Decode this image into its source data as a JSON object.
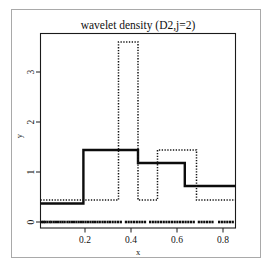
{
  "figure": {
    "title": "wavelet density (D2,j=2)",
    "xlabel": "x",
    "ylabel": "y",
    "background_color": "#ffffff",
    "frame_color": "#a9a9a9"
  },
  "axes": {
    "x_ticks": [
      "0.2",
      "0.4",
      "0.6",
      "0.8"
    ],
    "y_ticks": [
      "0",
      "1",
      "2",
      "3"
    ]
  },
  "chart_data": {
    "type": "line",
    "title": "wavelet density (D2,j=2)",
    "xlabel": "x",
    "ylabel": "y",
    "xlim": [
      0.0,
      1.0
    ],
    "ylim": [
      0.0,
      3.9
    ],
    "grid": false,
    "legend_position": "none",
    "x_tick_values": [
      0.2,
      0.4,
      0.6,
      0.8
    ],
    "y_tick_values": [
      0,
      1,
      2,
      3
    ],
    "series": [
      {
        "name": "wavelet density estimate",
        "style": "solid",
        "color": "#0c0c0c",
        "linewidth": 2.4,
        "representation": "step",
        "step_edges": [
          0.0,
          0.22,
          0.5,
          0.74,
          1.0
        ],
        "step_values": [
          0.37,
          1.44,
          1.18,
          0.72
        ]
      },
      {
        "name": "histogram density",
        "style": "dotted",
        "color": "#141414",
        "linewidth": 1.5,
        "representation": "step",
        "step_edges": [
          0.0,
          0.4,
          0.5,
          0.6,
          0.8,
          1.0
        ],
        "step_values": [
          0.44,
          3.6,
          0.44,
          1.44,
          0.44
        ]
      },
      {
        "name": "data rug",
        "style": "rug",
        "color": "#0d0d0d",
        "representation": "rug-at-zero",
        "y": 0.0,
        "x_values": [
          0.008,
          0.016,
          0.024,
          0.035,
          0.047,
          0.056,
          0.068,
          0.079,
          0.09,
          0.102,
          0.113,
          0.124,
          0.138,
          0.149,
          0.161,
          0.172,
          0.184,
          0.196,
          0.208,
          0.219,
          0.231,
          0.243,
          0.256,
          0.268,
          0.279,
          0.292,
          0.304,
          0.318,
          0.33,
          0.344,
          0.356,
          0.37,
          0.384,
          0.398,
          0.412,
          0.438,
          0.452,
          0.466,
          0.48,
          0.494,
          0.508,
          0.522,
          0.536,
          0.562,
          0.576,
          0.59,
          0.604,
          0.618,
          0.632,
          0.646,
          0.66,
          0.674,
          0.688,
          0.702,
          0.716,
          0.73,
          0.744,
          0.758,
          0.772,
          0.786,
          0.812,
          0.826,
          0.84,
          0.854,
          0.868,
          0.882,
          0.916,
          0.93,
          0.944,
          0.958,
          0.972,
          0.986
        ]
      }
    ]
  }
}
